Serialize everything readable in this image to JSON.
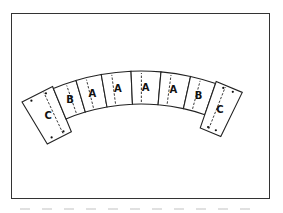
{
  "figure": {
    "segments": [
      {
        "label": "C",
        "dots": 4,
        "dashed_edge": "right"
      },
      {
        "label": "B",
        "dots": 0,
        "dashed_edge": "right"
      },
      {
        "label": "A",
        "dots": 0,
        "dashed_edge": "left"
      },
      {
        "label": "A",
        "dots": 0,
        "dashed_edge": "left"
      },
      {
        "label": "A",
        "dots": 0,
        "dashed_edge": "left"
      },
      {
        "label": "A",
        "dots": 0,
        "dashed_edge": "left"
      },
      {
        "label": "B",
        "dots": 0,
        "dashed_edge": "left"
      },
      {
        "label": "C",
        "dots": 4,
        "dashed_edge": "left"
      }
    ],
    "colors": {
      "stroke": "#222222",
      "fill": "#ffffff",
      "background": "#ffffff"
    }
  },
  "caption": {
    "text_visible": false
  }
}
